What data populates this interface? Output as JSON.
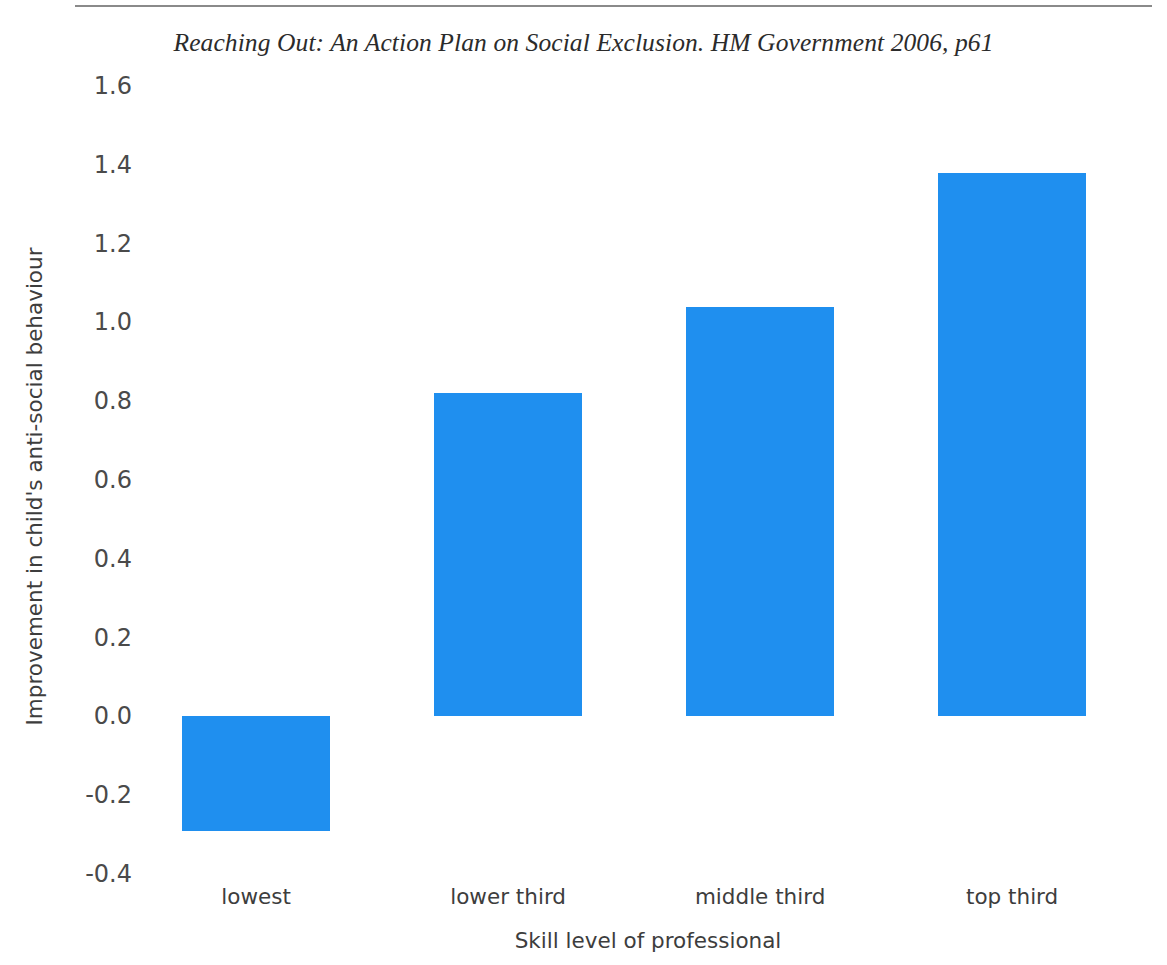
{
  "figure": {
    "caption": "Reaching Out: An Action Plan on Social Exclusion. HM Government 2006, p61",
    "top_rule": "horizontal-rule"
  },
  "chart_data": {
    "type": "bar",
    "title": "Reaching Out: An Action Plan on Social Exclusion. HM Government 2006, p61",
    "categories": [
      "lowest",
      "lower third",
      "middle third",
      "top third"
    ],
    "values": [
      -0.29,
      0.82,
      1.04,
      1.38
    ],
    "xlabel": "Skill level of professional",
    "ylabel": "Improvement in child's anti-social behaviour",
    "ylim": [
      -0.4,
      1.6
    ],
    "ytick_labels": [
      "1.6",
      "1.4",
      "1.2",
      "1.0",
      "0.8",
      "0.6",
      "0.4",
      "0.2",
      "0.0",
      "-0.2",
      "-0.4"
    ],
    "ytick_values": [
      1.6,
      1.4,
      1.2,
      1.0,
      0.8,
      0.6,
      0.4,
      0.2,
      0.0,
      -0.2,
      -0.4
    ],
    "grid": false,
    "legend": null,
    "bar_color": "#1f8fef",
    "series": [
      {
        "name": "Improvement in child's anti-social behaviour",
        "values": [
          -0.29,
          0.82,
          1.04,
          1.38
        ]
      }
    ]
  }
}
